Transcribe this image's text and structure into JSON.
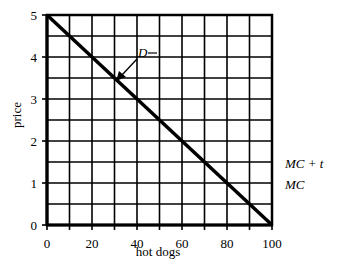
{
  "chart_data": {
    "type": "line",
    "title": "",
    "xlabel": "hot dogs",
    "ylabel": "price",
    "xlim": [
      0,
      100
    ],
    "ylim": [
      0,
      5
    ],
    "grid": true,
    "x_grid_step": 10,
    "y_grid_step": 0.5,
    "x_ticks": [
      0,
      20,
      40,
      60,
      80,
      100
    ],
    "y_ticks": [
      0,
      1,
      2,
      3,
      4,
      5
    ],
    "series": [
      {
        "name": "D",
        "x": [
          0,
          100
        ],
        "y": [
          5,
          0
        ]
      }
    ],
    "annotations": [
      {
        "text": "D",
        "x": 39,
        "y": 4.2,
        "arrow_to": {
          "x": 31,
          "y": 3.45
        }
      },
      {
        "text": "MC + t",
        "position": "right of plot",
        "y": 1.5
      },
      {
        "text": "MC",
        "position": "right of plot",
        "y": 1.0
      }
    ],
    "legend": null
  },
  "labels": {
    "xlabel": "hot dogs",
    "ylabel": "price",
    "demand": "D",
    "mc_plus_t": "MC + t",
    "mc": "MC",
    "x_ticks": [
      "0",
      "20",
      "40",
      "60",
      "80",
      "100"
    ],
    "y_ticks": [
      "0",
      "1",
      "2",
      "3",
      "4",
      "5"
    ]
  }
}
